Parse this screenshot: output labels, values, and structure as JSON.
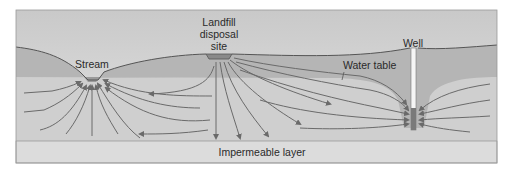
{
  "diagram": {
    "labels": {
      "stream": "Stream",
      "landfill_line1": "Landfill",
      "landfill_line2": "disposal",
      "landfill_line3": "site",
      "well": "Well",
      "water_table": "Water table",
      "impermeable": "Impermeable layer"
    },
    "colors": {
      "sky": "#d9d9d9",
      "unsaturated": "#b5b5b5",
      "saturated": "#cfcfcf",
      "impermeable": "#dcdcdc",
      "arrow": "#6a6a6a",
      "ground_line": "#555555",
      "well_screen": "#7a7a7a"
    }
  }
}
